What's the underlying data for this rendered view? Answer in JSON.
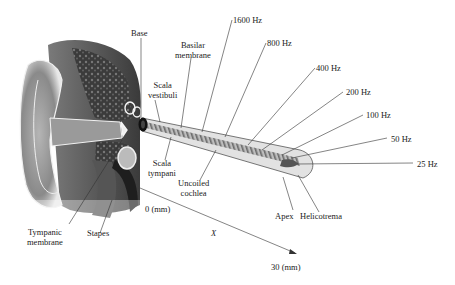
{
  "diagram": {
    "labels": {
      "base": "Base",
      "basilar_membrane": [
        "Basilar",
        "membrane"
      ],
      "scala_vestibuli": [
        "Scala",
        "vestibuli"
      ],
      "scala_tympani": [
        "Scala",
        "tympani"
      ],
      "uncoiled_cochlea": [
        "Uncoiled",
        "cochlea"
      ],
      "tympanic_membrane": [
        "Tympanic",
        "membrane"
      ],
      "stapes": "Stapes",
      "apex": "Apex",
      "helicotrema": "Helicotrema",
      "origin": "0 (mm)",
      "axis_label": "X",
      "axis_end": "30 (mm)"
    },
    "frequencies": [
      {
        "label": "1600 Hz"
      },
      {
        "label": "800 Hz"
      },
      {
        "label": "400 Hz"
      },
      {
        "label": "200 Hz"
      },
      {
        "label": "100 Hz"
      },
      {
        "label": "50 Hz"
      },
      {
        "label": "25 Hz"
      }
    ],
    "colors": {
      "ear_dark": "#3a3a3a",
      "ear_mid": "#8c8c8c",
      "ear_light": "#c8c8c8",
      "tube_fill": "#d9d9d9",
      "membrane_stripe": "#6e6e6e",
      "line": "#333333"
    }
  }
}
